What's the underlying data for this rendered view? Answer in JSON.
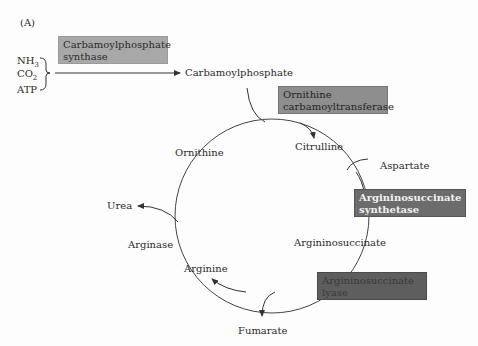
{
  "panel_label": "(A)",
  "inputs": {
    "nh3": "NH",
    "nh3_sub": "3",
    "co2": "CO",
    "co2_sub": "2",
    "atp": "ATP"
  },
  "enzymes": {
    "carbamoylphosphate_synthase": [
      "Carbamoylphosphate",
      "synthase"
    ],
    "ornithine_carbamoyltransferase": [
      "Ornithine",
      "carbamoyltransferase"
    ],
    "argininosuccinate_synthetase": [
      "Argininosuccinate",
      "synthetase"
    ],
    "argininosuccinate_lyase": [
      "Argininosuccinate",
      "lyase"
    ],
    "arginase": "Arginase"
  },
  "metabolites": {
    "carbamoylphosphate": "Carbamoylphosphate",
    "citrulline": "Citrulline",
    "aspartate": "Aspartate",
    "argininosuccinate": "Argininosuccinate",
    "arginine": "Arginine",
    "ornithine": "Ornithine",
    "urea": "Urea",
    "fumarate": "Fumarate"
  },
  "colors": {
    "box_light": "#a8a8a8",
    "box_mid": "#8e8e8e",
    "box_dark": "#6c6c6c",
    "box_darkest": "#5e5e5e",
    "line": "#333333"
  }
}
